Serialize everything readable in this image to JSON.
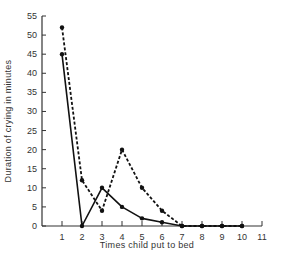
{
  "chart_data": {
    "type": "line",
    "title": "",
    "xlabel": "Times child put to bed",
    "ylabel": "Duration of crying in minutes",
    "x": [
      1,
      2,
      3,
      4,
      5,
      6,
      7,
      8,
      9,
      10
    ],
    "xticks": [
      1,
      2,
      3,
      4,
      5,
      6,
      7,
      8,
      9,
      10,
      11
    ],
    "yticks": [
      0,
      5,
      10,
      15,
      20,
      25,
      30,
      35,
      40,
      45,
      50,
      55
    ],
    "xlim": [
      0,
      11
    ],
    "ylim": [
      0,
      55
    ],
    "grid": false,
    "legend": null,
    "series": [
      {
        "name": "solid",
        "style": "solid",
        "values": [
          45,
          0,
          10,
          5,
          2,
          1,
          0,
          0,
          0,
          0
        ]
      },
      {
        "name": "dashed",
        "style": "dashed",
        "values": [
          52,
          12,
          4,
          20,
          10,
          4,
          0,
          0,
          0,
          0
        ]
      }
    ]
  },
  "colors": {
    "line": "#111111",
    "axis": "#333333",
    "text": "#333333"
  }
}
